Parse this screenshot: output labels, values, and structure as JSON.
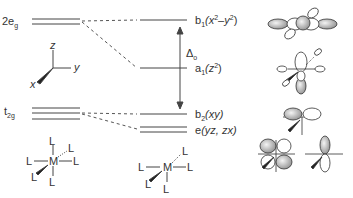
{
  "diagram": {
    "type": "MO energy level correlation diagram (octahedral to square pyramidal)",
    "colors": {
      "line": "#444444",
      "text": "#333333",
      "lobe_fill": "#bbbbbb"
    },
    "left_levels": [
      {
        "label": "2e",
        "sub": "g",
        "lines": 2
      },
      {
        "label": "t",
        "sub": "2g",
        "lines": 3
      }
    ],
    "right_levels": [
      {
        "label_main": "b",
        "label_sub": "1",
        "label_arg": "(x",
        "label_sup": "2",
        "label_mid": "–y",
        "label_sup2": "2",
        "label_end": ")",
        "lines": 1
      },
      {
        "label_main": "a",
        "label_sub": "1",
        "label_arg": "(z",
        "label_sup": "2",
        "label_end": ")",
        "lines": 1
      },
      {
        "label_main": "b",
        "label_sub": "2",
        "label_arg": "(xy)",
        "lines": 1
      },
      {
        "label_main": "e",
        "label_arg": "(yz, zx)",
        "lines": 2
      }
    ],
    "splitting": {
      "symbol": "Δ",
      "sub": "o"
    },
    "axes": {
      "x": "x",
      "y": "y",
      "z": "z"
    },
    "left_complex": {
      "center": "M",
      "ligand": "L",
      "count": 6
    },
    "right_complex": {
      "center": "M",
      "ligand": "L",
      "count": 5
    }
  }
}
